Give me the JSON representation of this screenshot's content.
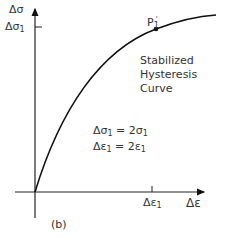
{
  "figure": {
    "panel_label": "(b)",
    "y_axis_label": "Δσ",
    "x_axis_label": "Δε",
    "y_tick_label": "Δσ",
    "y_tick_subscript": "1",
    "x_tick_label": "Δε",
    "x_tick_subscript": "1",
    "point_label": "P",
    "point_subscript": "1",
    "point_prime": "'",
    "curve_caption": [
      "Stabilized",
      "Hysteresis",
      "Curve"
    ],
    "equations": [
      {
        "lhs": "Δσ",
        "lhs_sub": "1",
        "rhs": " = 2σ",
        "rhs_sub": "1"
      },
      {
        "lhs": "Δε",
        "lhs_sub": "1",
        "rhs": " = 2ε",
        "rhs_sub": "1"
      }
    ]
  }
}
